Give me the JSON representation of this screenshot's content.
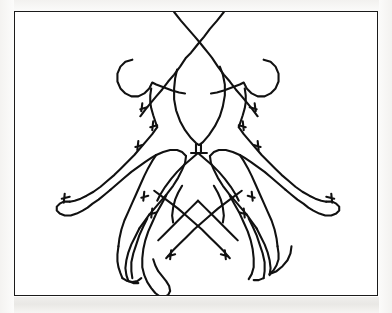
{
  "document": {
    "type": "scanned-line-art-illustration",
    "title": "",
    "caption": "",
    "background_color": "#fdfdfc",
    "page_color": "#ffffff"
  },
  "frame": {
    "name": "illustration-border",
    "stroke_color": "#1b1b1b",
    "stroke_width_px": 1.4,
    "x": 14,
    "y": 11,
    "width": 364,
    "height": 285
  },
  "artwork": {
    "name": "mirror-symmetric-figure-outline",
    "description": "Hand-traced contour line drawing of two mirrored human figures with outstretched arms and crossed legs, plus a central head and torso silhouette, crossing lines at the top",
    "stroke_color": "#111111",
    "stroke_width_px": 2.1,
    "fill": "none",
    "viewbox": "0 0 364 285",
    "axis_of_symmetry_x": 184,
    "strokes": [
      {
        "name": "crossing-line-left-to-right",
        "d": "M 160 0 L 167 9 L 174 17 L 181 25 L 186 31 L 190 36 L 194 41 L 198 46 L 204 55 L 210 63 L 216 70 L 222 78 L 228 85 L 233 91 L 238 97 L 241 101 L 244 105"
      },
      {
        "name": "crossing-line-right-to-left",
        "d": "M 210 0 L 203 9 L 196 17 L 190 25 L 185 31 L 181 36 L 177 41 L 172 46 L 166 55 L 160 63 L 154 70 L 148 78 L 142 85 L 137 91 L 132 97 L 129 101 L 126 105"
      },
      {
        "name": "left-arrow-barb-upper",
        "d": "M 133 96 L 126 98 M 128 92 L 127 100"
      },
      {
        "name": "right-arrow-barb-upper",
        "d": "M 236 96 L 243 98 M 241 92 L 242 100"
      },
      {
        "name": "central-head-outline",
        "d": "M 163 58 L 161 67 L 160 77 L 160 88 L 162 99 L 166 110 L 171 119 L 177 127 L 182 132 L 185 134 L 189 131 L 195 124 L 201 115 L 206 105 L 209 95 L 211 84 L 211 73 L 209 63 L 206 55"
      },
      {
        "name": "central-neck",
        "d": "M 182 133 L 182 141 M 187 133 L 187 141 M 177 142 L 193 142"
      },
      {
        "name": "central-torso-shoulders",
        "d": "M 184 142 L 177 148 L 170 154 L 163 161 L 157 168 L 151 176 L 146 184 L 143 190"
      },
      {
        "name": "central-torso-shoulders-right",
        "d": "M 184 142 L 191 148 L 198 154 L 205 161 L 211 168 L 217 176 L 222 184 L 225 190"
      },
      {
        "name": "left-figure-head-outline",
        "d": "M 118 48 L 111 50 L 106 55 L 103 62 L 103 70 L 106 77 L 111 82 L 117 85 L 124 85 L 130 82 L 135 77 L 138 71 L 142 73 L 150 76 L 158 79 L 165 81 L 171 82"
      },
      {
        "name": "left-figure-neck-shoulder",
        "d": "M 137 77 L 136 84 L 136 91 L 137 97 L 139 104 L 141 110 L 143 116"
      },
      {
        "name": "left-figure-shoulder-barb-a",
        "d": "M 143 114 L 136 116 M 139 110 L 138 119"
      },
      {
        "name": "left-figure-shoulder-barb-b",
        "d": "M 128 134 L 121 136 M 124 130 L 123 139"
      },
      {
        "name": "left-arm-upper-contour",
        "d": "M 143 116 L 138 123 L 132 130 L 126 137 L 120 144 L 113 151 L 106 158 L 100 164 L 93 170 L 86 176 L 79 181 L 72 185 L 66 188 L 60 190 L 55 191"
      },
      {
        "name": "left-hand",
        "d": "M 55 191 L 49 191 L 45 193 L 42 196 L 42 200 L 45 203 L 50 205 L 56 205 L 62 203 L 68 200 L 73 197 L 78 193 L 84 189 L 90 184 L 96 179"
      },
      {
        "name": "left-hand-thumb-barb",
        "d": "M 55 186 L 47 188 M 50 183 L 49 192"
      },
      {
        "name": "left-arm-lower-contour",
        "d": "M 96 179 L 103 173 L 110 167 L 117 161 L 124 156 L 131 151 L 137 147 L 142 144"
      },
      {
        "name": "left-shoulder-to-body",
        "d": "M 142 144 L 149 141 L 156 139 L 163 139 L 168 141 L 172 145"
      },
      {
        "name": "left-body-side-contour",
        "d": "M 172 145 L 171 152 L 168 159 L 164 167 L 159 175 L 153 183 L 147 190 L 141 197 L 135 204 L 130 211 L 125 218"
      },
      {
        "name": "left-body-outer-contour",
        "d": "M 142 144 L 138 150 L 134 157 L 130 165 L 126 174 L 122 183 L 118 192 L 114 201 L 110 210 L 107 219 L 105 228 L 104 236"
      },
      {
        "name": "left-elbow-barb",
        "d": "M 134 185 L 127 187 M 130 181 L 129 190"
      },
      {
        "name": "left-leg-outer",
        "d": "M 104 236 L 103 244 L 103 251 L 104 257 L 106 263 L 108 268"
      },
      {
        "name": "left-leg-outer-foot",
        "d": "M 108 268 L 113 271 L 118 272 L 123 271 L 127 268"
      },
      {
        "name": "left-leg-middle-a",
        "d": "M 125 218 L 121 226 L 117 234 L 114 242 L 112 250 L 111 258 L 112 265 L 114 271"
      },
      {
        "name": "left-leg-middle-b",
        "d": "M 133 208 L 129 216 L 125 225 L 122 234 L 119 243 L 117 252 L 117 261 L 118 268"
      },
      {
        "name": "left-foot-join",
        "d": "M 114 271 L 119 273 L 124 273"
      },
      {
        "name": "left-inner-leg",
        "d": "M 152 185 L 147 194 L 142 203 L 138 212 L 134 221 L 131 230 L 129 239 L 128 248 L 128 257 L 130 265 L 133 272 L 137 278 L 141 283 L 145 286 L 150 287 L 154 285 L 156 281 L 155 276 L 152 271 L 148 266 L 144 261 L 141 255 L 139 249"
      },
      {
        "name": "left-knee-barb",
        "d": "M 142 202 L 135 204 M 138 198 L 137 207"
      },
      {
        "name": "right-figure-head-outline",
        "d": "M 250 48 L 257 50 L 262 55 L 265 62 L 265 70 L 262 77 L 257 82 L 251 85 L 244 85 L 238 82 L 233 77 L 230 71 L 226 73 L 218 76 L 210 79 L 203 81 L 197 82"
      },
      {
        "name": "right-figure-neck-shoulder",
        "d": "M 231 77 L 232 84 L 232 91 L 231 97 L 229 104 L 227 110 L 225 116"
      },
      {
        "name": "right-figure-shoulder-barb-a",
        "d": "M 225 114 L 232 116 M 229 110 L 230 119"
      },
      {
        "name": "right-figure-shoulder-barb-b",
        "d": "M 240 134 L 247 136 M 244 130 L 245 139"
      },
      {
        "name": "right-arm-upper-contour",
        "d": "M 225 116 L 230 123 L 236 130 L 242 137 L 248 144 L 255 151 L 262 158 L 268 164 L 275 170 L 282 176 L 289 181 L 296 185 L 302 188 L 308 190 L 313 191"
      },
      {
        "name": "right-hand",
        "d": "M 313 191 L 319 191 L 323 193 L 326 196 L 326 200 L 323 203 L 318 205 L 312 205 L 306 203 L 300 200 L 295 197 L 290 193 L 284 189 L 278 184 L 272 179"
      },
      {
        "name": "right-hand-thumb-barb",
        "d": "M 313 186 L 321 188 M 318 183 L 319 192"
      },
      {
        "name": "right-arm-lower-contour",
        "d": "M 272 179 L 265 173 L 258 167 L 251 161 L 244 156 L 237 151 L 231 147 L 226 144"
      },
      {
        "name": "right-shoulder-to-body",
        "d": "M 226 144 L 219 141 L 212 139 L 205 139 L 200 141 L 196 145"
      },
      {
        "name": "right-body-side-contour",
        "d": "M 196 145 L 197 152 L 200 159 L 204 167 L 209 175 L 215 183 L 221 190 L 227 197 L 233 204 L 238 211 L 243 218"
      },
      {
        "name": "right-body-outer-contour",
        "d": "M 226 144 L 230 150 L 234 157 L 238 165 L 242 174 L 246 183 L 250 192 L 254 201 L 258 210 L 261 219 L 263 228 L 264 236"
      },
      {
        "name": "right-elbow-barb",
        "d": "M 234 185 L 241 187 M 238 181 L 239 190"
      },
      {
        "name": "right-leg-outer",
        "d": "M 264 236 L 265 243 L 265 249 L 263 255 L 260 260 L 256 264"
      },
      {
        "name": "right-leg-outer-hook",
        "d": "M 256 264 L 263 261 L 269 256 L 274 250 L 277 243 L 278 236"
      },
      {
        "name": "right-leg-middle-a",
        "d": "M 243 218 L 247 226 L 251 234 L 254 242 L 256 250 L 257 258 L 256 265"
      },
      {
        "name": "right-leg-middle-b",
        "d": "M 235 208 L 239 216 L 243 225 L 246 234 L 249 243 L 251 252 L 251 261 L 250 268"
      },
      {
        "name": "right-foot-join",
        "d": "M 250 268 L 245 270 L 240 270"
      },
      {
        "name": "right-inner-leg",
        "d": "M 216 185 L 221 194 L 226 203 L 230 212 L 234 221 L 237 230 L 239 239 L 240 248 L 240 257 L 238 264 L 235 269"
      },
      {
        "name": "right-knee-barb",
        "d": "M 226 202 L 233 204 M 230 198 L 231 207"
      },
      {
        "name": "center-hip-left-diagonal",
        "d": "M 184 190 L 177 197 L 170 204 L 163 211 L 156 218 L 150 224 L 144 230"
      },
      {
        "name": "center-hip-right-diagonal",
        "d": "M 184 190 L 191 197 L 198 204 L 205 211 L 212 218 L 218 224 L 224 230"
      },
      {
        "name": "center-upper-leg-left",
        "d": "M 168 175 L 164 182 L 161 189 L 159 197 L 158 205 L 159 212"
      },
      {
        "name": "center-upper-leg-right",
        "d": "M 200 175 L 204 182 L 207 189 L 209 197 L 210 205 L 209 212"
      },
      {
        "name": "center-crossing-left",
        "d": "M 140 180 L 148 186 L 156 192 L 164 198 L 172 205 L 180 212 L 188 219 L 196 227 L 203 234 L 210 241 L 216 248"
      },
      {
        "name": "center-crossing-right",
        "d": "M 228 180 L 220 186 L 212 192 L 204 198 L 196 205 L 188 212 L 180 219 L 172 227 L 165 234 L 158 241 L 152 248"
      },
      {
        "name": "center-lower-barb-left",
        "d": "M 161 244 L 154 246 M 157 240 L 156 249"
      },
      {
        "name": "center-lower-barb-right",
        "d": "M 207 244 L 214 246 M 211 240 L 212 249"
      }
    ]
  }
}
